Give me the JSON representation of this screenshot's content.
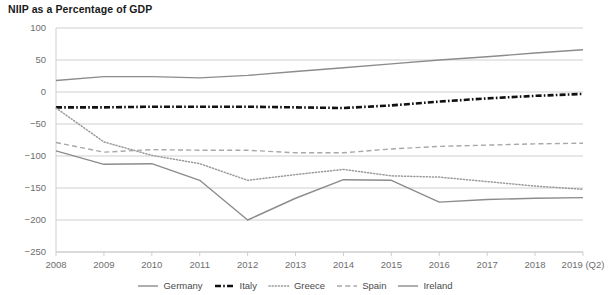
{
  "chart": {
    "title": "NIIP as a Percentage of GDP"
  },
  "chart_data": {
    "type": "line",
    "title": "NIIP as a Percentage of GDP",
    "xlabel": "",
    "ylabel": "",
    "ylim": [
      -250,
      100
    ],
    "yticks": [
      100,
      50,
      0,
      -50,
      -100,
      -150,
      -200,
      -250
    ],
    "ytick_labels": [
      "100",
      "50",
      "0",
      "−50",
      "−100",
      "−150",
      "−200",
      "−250"
    ],
    "grid": true,
    "legend_position": "bottom",
    "categories": [
      "2008",
      "2009",
      "2010",
      "2011",
      "2012",
      "2013",
      "2014",
      "2015",
      "2016",
      "2017",
      "2018",
      "2019 (Q2)"
    ],
    "x": [
      "2008",
      "2009",
      "2010",
      "2011",
      "2012",
      "2013",
      "2014",
      "2015",
      "2016",
      "2017",
      "2018",
      "2019 (Q2)"
    ],
    "series": [
      {
        "name": "Germany",
        "style": "solid",
        "color": "#8c8c8c",
        "values": [
          18,
          24,
          24,
          22,
          26,
          32,
          38,
          44,
          50,
          55,
          61,
          66
        ]
      },
      {
        "name": "Italy",
        "style": "dash-dot",
        "color": "#111111",
        "values": [
          -24,
          -24,
          -23,
          -23,
          -23,
          -24,
          -25,
          -21,
          -15,
          -10,
          -6,
          -3
        ]
      },
      {
        "name": "Greece",
        "style": "dotted",
        "color": "#9a9a9a",
        "values": [
          -25,
          -78,
          -99,
          -112,
          -138,
          -129,
          -121,
          -131,
          -133,
          -140,
          -147,
          -152
        ]
      },
      {
        "name": "Spain",
        "style": "dashed",
        "color": "#a8a8a8",
        "values": [
          -79,
          -94,
          -90,
          -91,
          -91,
          -95,
          -95,
          -89,
          -85,
          -83,
          -81,
          -80
        ]
      },
      {
        "name": "Ireland",
        "style": "solid",
        "color": "#8c8c8c",
        "values": [
          -92,
          -113,
          -112,
          -138,
          -200,
          -166,
          -137,
          -138,
          -172,
          -168,
          -166,
          -165
        ]
      }
    ]
  },
  "legend": {
    "items": [
      {
        "label": "Germany",
        "style": "solid",
        "color": "#8c8c8c"
      },
      {
        "label": "Italy",
        "style": "dash-dot",
        "color": "#111111"
      },
      {
        "label": "Greece",
        "style": "dotted",
        "color": "#9a9a9a"
      },
      {
        "label": "Spain",
        "style": "dashed",
        "color": "#a8a8a8"
      },
      {
        "label": "Ireland",
        "style": "solid",
        "color": "#8c8c8c"
      }
    ]
  },
  "axes": {
    "y_labels": [
      "100",
      "50",
      "0",
      "−50",
      "−100",
      "−150",
      "−200",
      "−250"
    ],
    "x_labels": [
      "2008",
      "2009",
      "2010",
      "2011",
      "2012",
      "2013",
      "2014",
      "2015",
      "2016",
      "2017",
      "2018",
      "2019 (Q2)"
    ]
  },
  "style": {
    "grid_color": "#c9c9c9",
    "axis_text_color": "#6e6e6e",
    "title_color": "#1a1a1a",
    "background": "#ffffff"
  }
}
